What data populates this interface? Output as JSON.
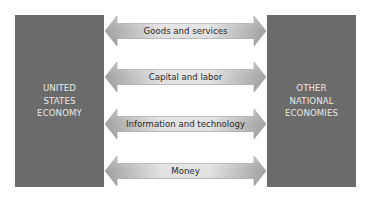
{
  "diagram": {
    "type": "flow-diagram",
    "left_box": {
      "label": "UNITED\nSTATES\nECONOMY",
      "color": "#6b6b6b"
    },
    "right_box": {
      "label": "OTHER\nNATIONAL\nECONOMIES",
      "color": "#6b6b6b"
    },
    "flows": [
      {
        "label": "Goods and services",
        "direction": "bidirectional"
      },
      {
        "label": "Capital and labor",
        "direction": "bidirectional"
      },
      {
        "label": "Information and technology",
        "direction": "bidirectional"
      },
      {
        "label": "Money",
        "direction": "bidirectional"
      }
    ],
    "colors": {
      "box": "#6b6b6b",
      "box_text": "#e8e8e8",
      "arrow_light": "#e6e6e6",
      "arrow_dark": "#a8a8a8",
      "arrow_text": "#2a2a2a"
    }
  }
}
